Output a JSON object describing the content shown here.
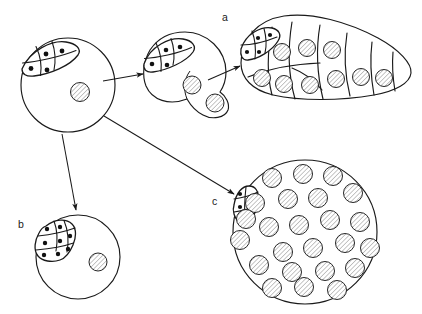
{
  "figure": {
    "background_color": "#ffffff",
    "line_color": "#1a1a1a",
    "hatch_color": "#8a8a8a",
    "width": 422,
    "height": 314
  },
  "labels": [
    {
      "id": "label-a",
      "text": "a",
      "x": 222,
      "y": 21
    },
    {
      "id": "label-b",
      "text": "b",
      "x": 18,
      "y": 228
    },
    {
      "id": "label-c",
      "text": "c",
      "x": 212,
      "y": 205
    }
  ],
  "stages": [
    {
      "id": "stage-initial",
      "name": "initial-cell",
      "label": "",
      "shape": "circle",
      "center": [
        68,
        85
      ],
      "radius": 47,
      "germ_cell_count": 4,
      "vesicle_count": 1,
      "vesicles": [
        {
          "cx": 80,
          "cy": 92,
          "r": 9.5
        }
      ]
    },
    {
      "id": "stage-intermediate",
      "name": "intermediate-cell",
      "label": "",
      "shape": "circle-with-lobe",
      "center": [
        185,
        73
      ],
      "radius": 41,
      "germ_cell_count": 4,
      "vesicle_count": 2,
      "vesicles": [
        {
          "cx": 192,
          "cy": 85,
          "r": 9
        },
        {
          "cx": 216,
          "cy": 102,
          "r": 9
        }
      ]
    },
    {
      "id": "stage-a",
      "name": "elongated-segmented-body",
      "label": "a",
      "shape": "teardrop-segmented",
      "segment_count": 6,
      "germ_cell_count": 4,
      "vesicle_count": 11,
      "vesicles": [
        {
          "cx": 282,
          "cy": 52,
          "r": 8.5
        },
        {
          "cx": 307,
          "cy": 48,
          "r": 8.5
        },
        {
          "cx": 332,
          "cy": 50,
          "r": 8.5
        },
        {
          "cx": 296,
          "cy": 79,
          "r": 8.5
        },
        {
          "cx": 324,
          "cy": 83,
          "r": 8.5
        },
        {
          "cx": 349,
          "cy": 73,
          "r": 8.5
        },
        {
          "cx": 371,
          "cy": 77,
          "r": 8.5
        },
        {
          "cx": 393,
          "cy": 78,
          "r": 8.5
        },
        {
          "cx": 262,
          "cy": 78,
          "r": 8.5
        }
      ]
    },
    {
      "id": "stage-b",
      "name": "proliferated-germ-cell-mass",
      "label": "b",
      "shape": "circle",
      "center": [
        78,
        257
      ],
      "radius": 42,
      "germ_cell_count": 8,
      "vesicle_count": 1,
      "vesicles": [
        {
          "cx": 98,
          "cy": 262,
          "r": 9
        }
      ]
    },
    {
      "id": "stage-c",
      "name": "proliferated-vesicle-mass",
      "label": "c",
      "shape": "circle",
      "center": [
        305,
        232
      ],
      "radius": 72,
      "germ_cell_count": 4,
      "vesicle_count": 24,
      "vesicles": [
        {
          "cx": 272,
          "cy": 178,
          "r": 9.5
        },
        {
          "cx": 303,
          "cy": 174,
          "r": 9.5
        },
        {
          "cx": 333,
          "cy": 176,
          "r": 9.5
        },
        {
          "cx": 255,
          "cy": 203,
          "r": 9.5
        },
        {
          "cx": 288,
          "cy": 199,
          "r": 9.5
        },
        {
          "cx": 318,
          "cy": 198,
          "r": 9.5
        },
        {
          "cx": 353,
          "cy": 193,
          "r": 9.5
        },
        {
          "cx": 269,
          "cy": 227,
          "r": 9.5
        },
        {
          "cx": 299,
          "cy": 225,
          "r": 9.5
        },
        {
          "cx": 330,
          "cy": 220,
          "r": 9.5
        },
        {
          "cx": 360,
          "cy": 222,
          "r": 9.5
        },
        {
          "cx": 249,
          "cy": 236,
          "r": 9.5
        },
        {
          "cx": 283,
          "cy": 252,
          "r": 9.5
        },
        {
          "cx": 313,
          "cy": 248,
          "r": 9.5
        },
        {
          "cx": 345,
          "cy": 243,
          "r": 9.5
        },
        {
          "cx": 370,
          "cy": 248,
          "r": 9.5
        },
        {
          "cx": 259,
          "cy": 265,
          "r": 9.5
        },
        {
          "cx": 292,
          "cy": 272,
          "r": 9.5
        },
        {
          "cx": 325,
          "cy": 271,
          "r": 9.5
        },
        {
          "cx": 355,
          "cy": 268,
          "r": 9.5
        },
        {
          "cx": 272,
          "cy": 288,
          "r": 9.5
        },
        {
          "cx": 304,
          "cy": 287,
          "r": 9.5
        },
        {
          "cx": 337,
          "cy": 290,
          "r": 9.5
        },
        {
          "cx": 240,
          "cy": 260,
          "r": 9.5
        }
      ]
    }
  ],
  "arrows": [
    {
      "id": "arrow-initial-to-intermediate",
      "from": "stage-initial",
      "to": "stage-intermediate",
      "x1": 103,
      "y1": 80,
      "x2": 143,
      "y2": 74
    },
    {
      "id": "arrow-intermediate-to-a",
      "from": "stage-intermediate",
      "to": "stage-a",
      "x1": 212,
      "y1": 78,
      "x2": 240,
      "y2": 66
    },
    {
      "id": "arrow-initial-to-b",
      "from": "stage-initial",
      "to": "stage-b",
      "x1": 62,
      "y1": 134,
      "x2": 75,
      "y2": 208
    },
    {
      "id": "arrow-initial-to-c",
      "from": "stage-initial",
      "to": "stage-c",
      "x1": 104,
      "y1": 115,
      "x2": 236,
      "y2": 193
    }
  ]
}
